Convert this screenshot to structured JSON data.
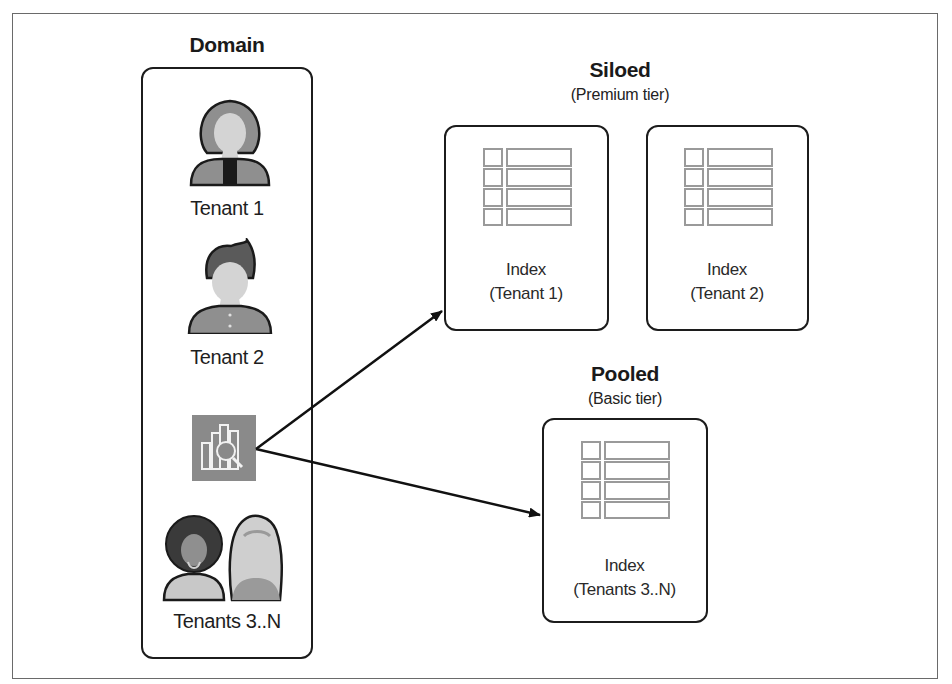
{
  "domain_panel": {
    "title": "Domain",
    "tenants": [
      {
        "label": "Tenant 1",
        "icon": "woman-avatar-icon"
      },
      {
        "label": "Tenant 2",
        "icon": "man-avatar-icon"
      },
      {
        "label": "Tenants 3..N",
        "icon": "group-avatars-icon"
      }
    ],
    "service_icon": "search-analytics-icon",
    "service_icon_color": "#8a8a8a"
  },
  "siloed": {
    "title": "Siloed",
    "subtitle": "(Premium tier)",
    "indexes": [
      {
        "line1": "Index",
        "line2": "(Tenant 1)"
      },
      {
        "line1": "Index",
        "line2": "(Tenant 2)"
      }
    ]
  },
  "pooled": {
    "title": "Pooled",
    "subtitle": "(Basic tier)",
    "index": {
      "line1": "Index",
      "line2": "(Tenants 3..N)"
    }
  },
  "colors": {
    "border": "#1c1c1c",
    "table_stroke": "#9a9a9a",
    "avatar_fill": "#8f8f8f",
    "face_fill": "#d4d4d4"
  }
}
